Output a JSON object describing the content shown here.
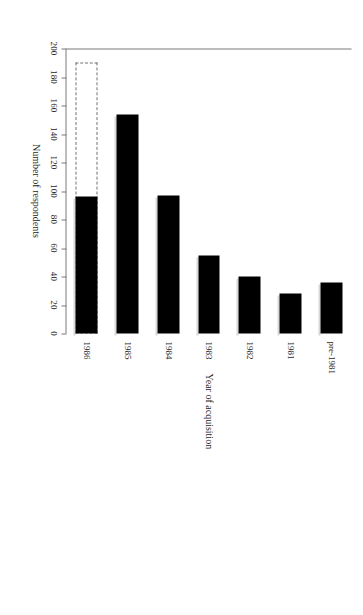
{
  "figure": {
    "orientation": "rotated-90-clockwise",
    "background_color": "#ffffff",
    "bar_color": "#000000",
    "projected_bar_outline_color": "#707070",
    "axis_color": "#7a7a7a"
  },
  "chart_data": {
    "type": "bar",
    "title": "",
    "subtitle": "",
    "xlabel": "Year of acquisition",
    "ylabel": "Number of respondents",
    "categories": [
      "pre-1981",
      "1981",
      "1982",
      "1983",
      "1984",
      "1985",
      "1986"
    ],
    "values": [
      36,
      28,
      40,
      55,
      97,
      154,
      96
    ],
    "series": [
      {
        "name": "Number of respondents",
        "values": [
          36,
          28,
          40,
          55,
          97,
          154,
          96
        ]
      },
      {
        "name": "Projected (1986 full year)",
        "values": [
          null,
          null,
          null,
          null,
          null,
          null,
          190
        ]
      }
    ],
    "projected": {
      "category": "1986",
      "value": 190,
      "style": "dashed-outline",
      "note": "dashed outline extension beyond the solid bar"
    },
    "ylim": [
      0,
      200
    ],
    "yticks": [
      0,
      20,
      40,
      60,
      80,
      100,
      120,
      140,
      160,
      180,
      200
    ],
    "ytick_labels": [
      "0",
      "20",
      "40",
      "60",
      "80",
      "100",
      "120",
      "140",
      "160",
      "180",
      "200"
    ],
    "grid": false,
    "legend": null,
    "legend_position": "none",
    "annotations": []
  },
  "axes": {
    "value_axis_title": "Number of respondents",
    "category_axis_title": "Year of acquisition",
    "tick_labels": [
      "200",
      "180",
      "160",
      "140",
      "120",
      "100",
      "80",
      "60",
      "40",
      "20",
      "0"
    ]
  }
}
